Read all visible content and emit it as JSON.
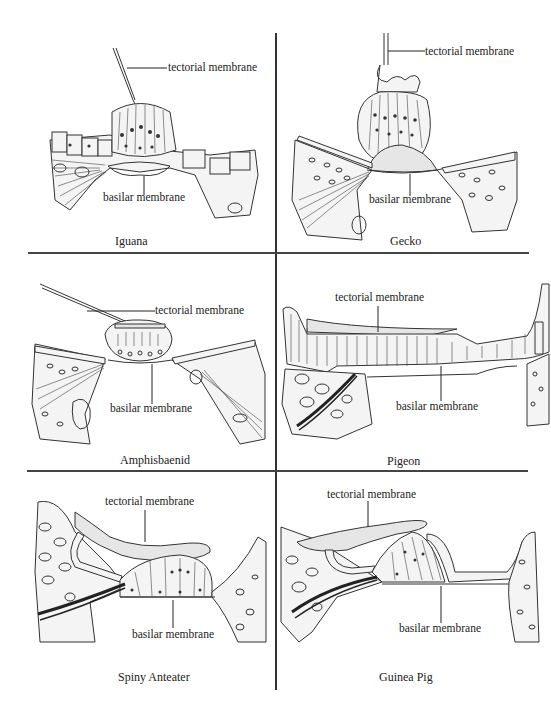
{
  "figure": {
    "layout": {
      "rows": 3,
      "columns": 2
    },
    "colors": {
      "ink": "#222222",
      "background": "#ffffff",
      "divider": "#333333"
    },
    "panels": [
      {
        "id": "iguana",
        "caption": "Iguana",
        "labels": {
          "tectorial": "tectorial membrane",
          "basilar": "basilar membrane"
        }
      },
      {
        "id": "gecko",
        "caption": "Gecko",
        "labels": {
          "tectorial": "tectorial membrane",
          "basilar": "basilar membrane"
        }
      },
      {
        "id": "amphisbaenid",
        "caption": "Amphisbaenid",
        "labels": {
          "tectorial": "tectorial membrane",
          "basilar": "basilar membrane"
        }
      },
      {
        "id": "pigeon",
        "caption": "Pigeon",
        "labels": {
          "tectorial": "tectorial membrane",
          "basilar": "basilar membrane"
        }
      },
      {
        "id": "spiny-anteater",
        "caption": "Spiny Anteater",
        "labels": {
          "tectorial": "tectorial membrane",
          "basilar": "basilar membrane"
        }
      },
      {
        "id": "guinea-pig",
        "caption": "Guinea Pig",
        "labels": {
          "tectorial": "tectorial membrane",
          "basilar": "basilar membrane"
        }
      }
    ]
  }
}
